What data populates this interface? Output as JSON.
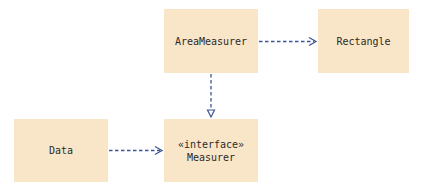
{
  "diagram": {
    "type": "UML class diagram",
    "colors": {
      "box_fill": "#f9e6c8",
      "arrow": "#3d5596",
      "text": "#2a2a2a"
    },
    "boxes": [
      {
        "id": "area_measurer",
        "label": "AreaMeasurer"
      },
      {
        "id": "rectangle",
        "label": "Rectangle"
      },
      {
        "id": "data",
        "label": "Data"
      },
      {
        "id": "measurer",
        "stereotype": "«interface»",
        "label": "Measurer"
      }
    ],
    "edges": [
      {
        "from": "AreaMeasurer",
        "to": "Rectangle",
        "kind": "dependency",
        "style": "dashed, open arrowhead"
      },
      {
        "from": "AreaMeasurer",
        "to": "Measurer",
        "kind": "realization",
        "style": "dashed, hollow triangle"
      },
      {
        "from": "Data",
        "to": "Measurer",
        "kind": "dependency",
        "style": "dashed, open arrowhead"
      }
    ]
  }
}
